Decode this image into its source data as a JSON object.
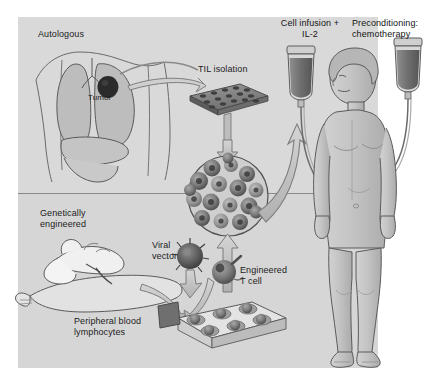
{
  "figure": {
    "type": "scientific-diagram",
    "background_color": "#ffffff",
    "panel_color": "#d9d9d9",
    "ink_color": "#1c1c1c"
  },
  "labels": {
    "autologous": "Autologous",
    "tumor": "Tumor",
    "til_isolation": "TIL isolation",
    "cell_infusion": "Cell infusion +\nIL-2",
    "preconditioning": "Preconditioning:\nchemotherapy",
    "genetically_engineered": "Genetically\nengineered",
    "viral_vector": "Viral\nvector",
    "peripheral_blood": "Peripheral blood\nlymphocytes",
    "engineered_t_cell": "Engineered\nT cell"
  },
  "icons": {
    "lungs": "lungs-icon",
    "tumor_mass": "tumor-mass-icon",
    "well_plate": "well-plate-icon",
    "cell_culture": "cell-culture-circle-icon",
    "iv_bag_left": "iv-bag-icon",
    "iv_bag_right": "iv-bag-icon",
    "patient": "standing-patient-icon",
    "arm_blood_draw": "arm-blood-draw-icon",
    "virus_particle": "virus-particle-icon",
    "t_cell": "engineered-t-cell-icon",
    "culture_tray": "culture-tray-icon",
    "arrow_tumor_to_plate": "curved-arrow-icon",
    "arrow_plate_down": "down-arrow-icon",
    "arrow_culture_to_patient": "curved-arrow-icon",
    "arrow_virus_down": "down-arrow-icon",
    "arrow_tray_to_cell": "curved-arrow-icon",
    "arrow_cell_up": "up-arrow-icon",
    "arrow_arm_to_tray": "curved-arrow-icon"
  },
  "colors": {
    "panel": "#d9d9d9",
    "panel_lower": "#d6d6d6",
    "divider": "#8a8a8a",
    "outline": "#5a5a5a",
    "organ_fill": "#bdbdbd",
    "tumor": "#2b2b2b",
    "arrow_fill": "#c2c2c2",
    "arrow_stroke": "#6f6f6f",
    "iv_fluid": "#7a7a7a",
    "skin": "#c9c9c9",
    "cell_dark": "#5e5e5e",
    "cell_mid": "#8d8d8d"
  }
}
